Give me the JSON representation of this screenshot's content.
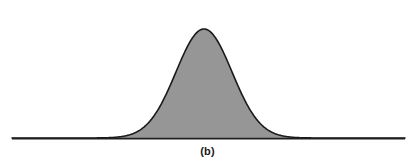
{
  "figure": {
    "caption": "(b)",
    "background_color": "#ffffff",
    "stroke_color": "#1a1a1a",
    "fill_color": "#969696",
    "baseline_color": "#1f1f1f"
  },
  "chart_data": {
    "type": "area",
    "title": "",
    "subtitle": "",
    "xlabel": "",
    "ylabel": "",
    "caption": "(b)",
    "grid": false,
    "legend": null,
    "axis": {
      "x_axis_visible": true,
      "y_axis_visible": false,
      "x_axis_y_pixel": 138,
      "x_axis_start_pixel": 12,
      "x_axis_end_pixel": 405
    },
    "distribution": {
      "shape": "normal-bell-curve",
      "mean_x": 204,
      "sigma_x": 28,
      "peak_y_pixel": 29,
      "baseline_y_pixel": 138,
      "amplitude_pixels": 109,
      "left_liftoff_x": 96,
      "right_return_x": 312,
      "half_max_left_x": 172,
      "half_max_right_x": 237
    },
    "series": [
      {
        "name": "density",
        "x": [
          12,
          30,
          50,
          70,
          85,
          96,
          110,
          120,
          130,
          140,
          150,
          160,
          168,
          176,
          184,
          190,
          196,
          200,
          204,
          208,
          212,
          218,
          224,
          232,
          240,
          248,
          256,
          264,
          272,
          282,
          292,
          302,
          312,
          330,
          350,
          375,
          405
        ],
        "values": [
          0,
          0,
          0.001,
          0.003,
          0.008,
          0.015,
          0.033,
          0.052,
          0.079,
          0.116,
          0.166,
          0.265,
          0.358,
          0.471,
          0.608,
          0.718,
          0.829,
          0.898,
          0.958,
          0.99,
          0.999,
          0.96,
          0.888,
          0.75,
          0.6,
          0.455,
          0.33,
          0.227,
          0.15,
          0.085,
          0.045,
          0.022,
          0.01,
          0.003,
          0.001,
          0,
          0
        ]
      }
    ],
    "ylim": [
      0,
      1
    ],
    "xlim": [
      12,
      405
    ]
  }
}
